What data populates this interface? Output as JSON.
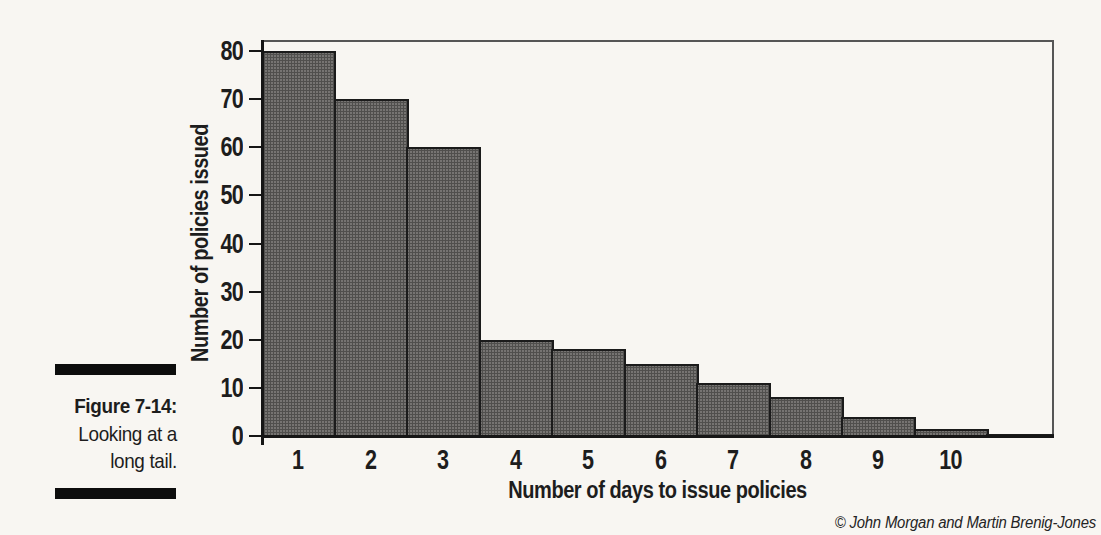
{
  "figure": {
    "caption": {
      "label": "Figure 7-14:",
      "line1": "Looking at a",
      "line2": "long tail."
    },
    "credit": "© John Morgan and Martin Brenig-Jones"
  },
  "chart_data": {
    "type": "bar",
    "title": "",
    "xlabel": "Number of days to issue policies",
    "ylabel": "Number of policies issued",
    "categories": [
      "1",
      "2",
      "3",
      "4",
      "5",
      "6",
      "7",
      "8",
      "9",
      "10"
    ],
    "values": [
      80,
      70,
      60,
      20,
      18,
      15,
      11,
      8,
      4,
      1.5
    ],
    "tail": {
      "label": "",
      "value": 0.5
    },
    "y_ticks": [
      0,
      10,
      20,
      30,
      40,
      50,
      60,
      70,
      80
    ],
    "ylim": [
      0,
      82
    ],
    "grid": false,
    "legend": "none",
    "bar_style": "contiguous-histogram",
    "bar_color": "#6f6d6a",
    "bar_border_color": "#1b1b1b",
    "axis_color": "#161616",
    "frame_color": "#565656",
    "paper_color": "#f8f6f2"
  }
}
